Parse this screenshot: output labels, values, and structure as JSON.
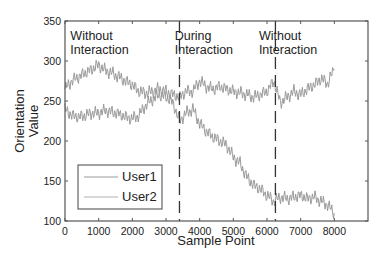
{
  "chart_data": {
    "type": "line",
    "title": "",
    "xlabel": "Sample Point",
    "ylabel": "Orientation Value",
    "ylabel_lines": [
      "Orientation",
      "Value"
    ],
    "xlim": [
      0,
      9000
    ],
    "ylim": [
      100,
      350
    ],
    "x_ticks": [
      0,
      1000,
      2000,
      3000,
      4000,
      5000,
      6000,
      7000,
      8000
    ],
    "x_tick_labels": [
      "0",
      "1000",
      "2000",
      "3000",
      "4000",
      "5000",
      "6000",
      "7000",
      "8000"
    ],
    "y_ticks": [
      100,
      150,
      200,
      250,
      300,
      350
    ],
    "y_tick_labels": [
      "100",
      "150",
      "200",
      "250",
      "300",
      "350"
    ],
    "grid": false,
    "legend_position": "lower left",
    "x": [
      0,
      200,
      400,
      600,
      800,
      1000,
      1200,
      1400,
      1600,
      1800,
      2000,
      2200,
      2400,
      2600,
      2800,
      3000,
      3200,
      3400,
      3600,
      3800,
      4000,
      4200,
      4400,
      4600,
      4800,
      5000,
      5200,
      5400,
      5600,
      5800,
      6000,
      6200,
      6400,
      6600,
      6800,
      7000,
      7200,
      7400,
      7600,
      7800,
      8000
    ],
    "series": [
      {
        "name": "User1",
        "color": "#9a9a9a",
        "values": [
          265,
          275,
          280,
          285,
          290,
          295,
          288,
          285,
          280,
          275,
          270,
          262,
          260,
          262,
          265,
          262,
          258,
          255,
          262,
          262,
          275,
          268,
          265,
          268,
          265,
          262,
          260,
          258,
          255,
          258,
          262,
          275,
          248,
          255,
          262,
          258,
          265,
          270,
          278,
          272,
          290
        ]
      },
      {
        "name": "User2",
        "color": "#9a9a9a",
        "values": [
          240,
          232,
          230,
          232,
          235,
          235,
          238,
          236,
          234,
          230,
          228,
          232,
          245,
          252,
          258,
          255,
          248,
          225,
          235,
          240,
          222,
          212,
          205,
          200,
          195,
          180,
          172,
          155,
          145,
          140,
          132,
          125,
          130,
          128,
          130,
          132,
          128,
          130,
          125,
          120,
          110
        ]
      }
    ],
    "vertical_markers": [
      {
        "x": 3400,
        "style": "dashed"
      },
      {
        "x": 6250,
        "style": "dashed"
      }
    ],
    "annotations": [
      {
        "lines": [
          "Without",
          "Interaction"
        ],
        "x": 1050,
        "y": 330
      },
      {
        "lines": [
          "During",
          "Interaction"
        ],
        "x": 4150,
        "y": 330
      },
      {
        "lines": [
          "Without",
          "Interaction"
        ],
        "x": 6650,
        "y": 330
      }
    ],
    "legend": [
      "User1",
      "User2"
    ]
  }
}
